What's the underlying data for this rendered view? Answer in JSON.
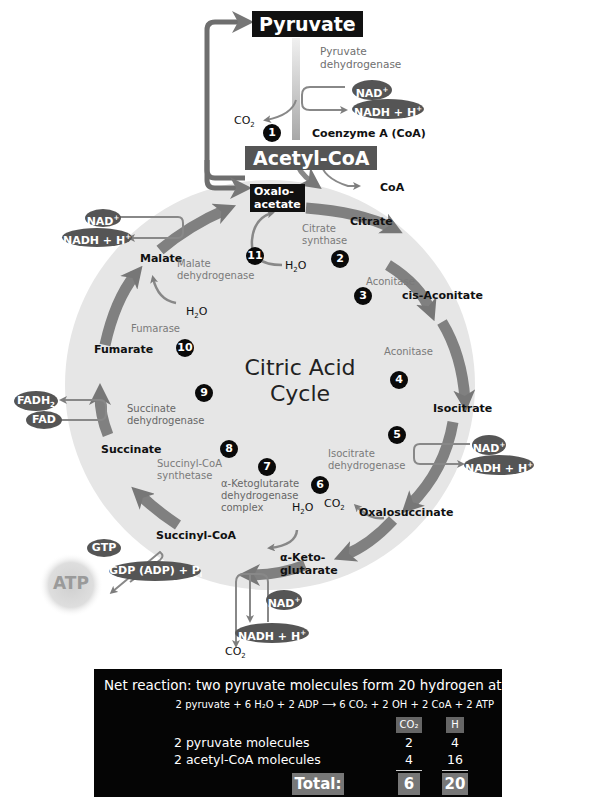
{
  "diagram": {
    "title_line1": "Citric Acid",
    "title_line2": "Cycle",
    "colors": {
      "cycle_fill": "#e6e6e6",
      "arrow": "#7d7d7d",
      "dark_box": "#111111",
      "acetyl_box": "#555555",
      "pill": "#555555",
      "enzyme_text": "#7a7a7a"
    },
    "top": {
      "pyruvate": "Pyruvate",
      "pyruvate_enzyme_line1": "Pyruvate",
      "pyruvate_enzyme_line2": "dehydrogenase",
      "nad": "NAD",
      "nad_sup": "+",
      "nadh": "NADH + H",
      "nadh_sup": "+",
      "co2": "CO",
      "co2_sub": "2",
      "step": "1",
      "coenzyme": "Coenzyme A (CoA)",
      "acetyl_coa": "Acetyl-CoA",
      "coa_out": "CoA"
    },
    "intermediates": {
      "oxaloacetate_line1": "Oxalo-",
      "oxaloacetate_line2": "acetate",
      "citrate": "Citrate",
      "cis_aconitate": "cis-Aconitate",
      "isocitrate": "Isocitrate",
      "oxalosuccinate": "Oxalosuccinate",
      "akg_line1": "α-Keto-",
      "akg_line2": "glutarate",
      "succinyl_coa": "Succinyl-CoA",
      "succinate": "Succinate",
      "fumarate": "Fumarate",
      "malate": "Malate"
    },
    "enzymes": {
      "citrate_synthase_line1": "Citrate",
      "citrate_synthase_line2": "synthase",
      "aconitase_a": "Aconitase",
      "aconitase_b": "Aconitase",
      "isocitrate_dh_line1": "Isocitrate",
      "isocitrate_dh_line2": "dehydrogenase",
      "akg_dh_line1": "α-Ketoglutarate",
      "akg_dh_line2": "dehydrogenase",
      "akg_dh_line3": "complex",
      "succinyl_synth_line1": "Succinyl-CoA",
      "succinyl_synth_line2": "synthetase",
      "succinate_dh_line1": "Succinate",
      "succinate_dh_line2": "dehydrogenase",
      "fumarase": "Fumarase",
      "malate_dh_line1": "Malate",
      "malate_dh_line2": "dehydrogenase"
    },
    "steps": [
      "1",
      "2",
      "3",
      "4",
      "5",
      "6",
      "7",
      "8",
      "9",
      "10",
      "11"
    ],
    "cofactors": {
      "h2o": "H",
      "h2o_sub": "2",
      "h2o_o": "O",
      "co2": "CO",
      "co2_sub": "2",
      "nad": "NAD",
      "plus": "+",
      "nadh": "NADH + H",
      "fadh": "FADH",
      "fadh_sub": "2",
      "fad": "FAD",
      "gtp": "GTP",
      "gdp": "GDP (ADP) + P",
      "gdp_sub": "i",
      "atp": "ATP"
    }
  },
  "net_reaction": {
    "heading": "Net reaction: two pyruvate molecules form 20 hydrogen atoms",
    "equation_left": "2 pyruvate + 6 H₂O + 2 ADP",
    "equation_arrow": "⟶",
    "equation_right": "6 CO₂ + 2 OH + 2 CoA + 2 ATP",
    "col_headers": [
      "CO₂",
      "H"
    ],
    "rows": [
      {
        "label": "2 pyruvate molecules",
        "co2": "2",
        "h": "4"
      },
      {
        "label": "2 acetyl-CoA molecules",
        "co2": "4",
        "h": "16"
      }
    ],
    "total_label": "Total:",
    "total_co2": "6",
    "total_h": "20"
  }
}
